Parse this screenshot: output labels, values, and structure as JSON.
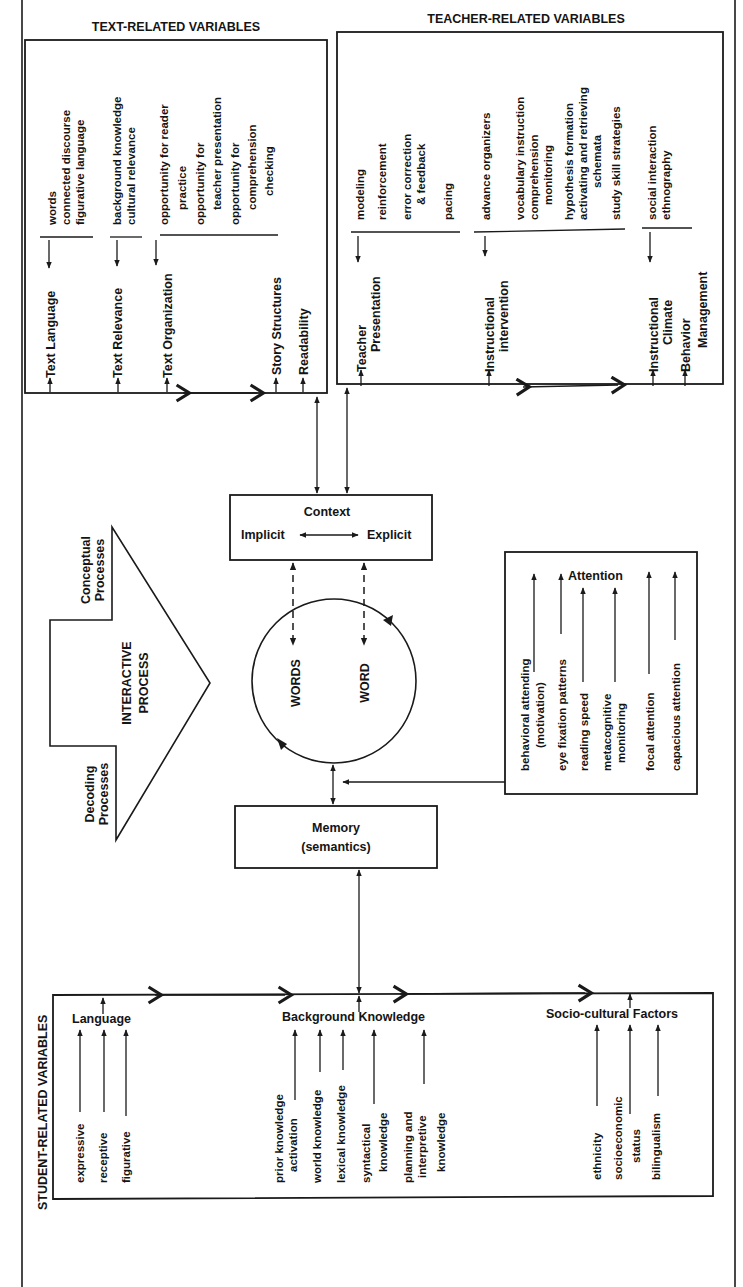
{
  "diagram": {
    "text_related": {
      "heading": "TEXT-RELATED VARIABLES",
      "categories": [
        {
          "label": "Text Language",
          "items": [
            "words",
            "connected discourse",
            "figurative language"
          ]
        },
        {
          "label": "Text Relevance",
          "items": [
            "background knowledge",
            "cultural relevance"
          ]
        },
        {
          "label": "Text Organization",
          "items": [
            "opportunity for reader",
            "practice",
            "opportunity for",
            "teacher presentation",
            "opportunity for",
            "comprehension",
            "checking"
          ]
        },
        {
          "label": "Story Structures",
          "items": []
        },
        {
          "label": "Readability",
          "items": []
        }
      ]
    },
    "teacher_related": {
      "heading": "TEACHER-RELATED VARIABLES",
      "categories": [
        {
          "label_lines": [
            "Teacher",
            "Presentation"
          ],
          "items": [
            "modeling",
            "reinforcement",
            "error correction",
            "& feedback",
            "pacing"
          ]
        },
        {
          "label_lines": [
            "Instructional",
            "intervention"
          ],
          "items": [
            "advance organizers",
            "vocabulary instruction",
            "comprehension",
            "monitoring",
            "hypothesis formation",
            "activating and retrieving",
            "schemata",
            "study skill strategies"
          ]
        },
        {
          "label_lines": [
            "Instructional",
            "Climate"
          ],
          "items": [
            "social interaction",
            "ethnography"
          ]
        },
        {
          "label_lines": [
            "Behavior",
            "Management"
          ],
          "items": []
        }
      ]
    },
    "context": {
      "title": "Context",
      "left": "Implicit",
      "right": "Explicit"
    },
    "interactive_process": {
      "label_lines": [
        "INTERACTIVE",
        "PROCESS"
      ],
      "top": [
        "Conceptual",
        "Processes"
      ],
      "bottom": [
        "Decoding",
        "Processes"
      ]
    },
    "cycle": {
      "left": "WORDS",
      "right": "WORD"
    },
    "memory": {
      "title": "Memory",
      "subtitle": "(semantics)"
    },
    "attention": {
      "title": "Attention",
      "items": [
        [
          "behavioral attending",
          "(motivation)"
        ],
        [
          "eye fixation patterns"
        ],
        [
          "reading speed"
        ],
        [
          "metacognitive",
          "monitoring"
        ],
        [
          "focal attention"
        ],
        [
          "capacious attention"
        ]
      ]
    },
    "student_related": {
      "heading": "STUDENT-RELATED VARIABLES",
      "groups": [
        {
          "title": "Language",
          "items": [
            [
              "expressive"
            ],
            [
              "receptive"
            ],
            [
              "figurative"
            ]
          ]
        },
        {
          "title": "Background Knowledge",
          "items": [
            [
              "prior knowledge",
              "activation"
            ],
            [
              "world knowledge"
            ],
            [
              "lexical knowledge"
            ],
            [
              "syntactical",
              "knowledge"
            ],
            [
              "planning and",
              "interpretive",
              "knowledge"
            ]
          ]
        },
        {
          "title": "Socio-cultural Factors",
          "items": [
            [
              "ethnicity"
            ],
            [
              "socioeconomic",
              "status"
            ],
            [
              "bilingualism"
            ]
          ]
        }
      ]
    }
  }
}
